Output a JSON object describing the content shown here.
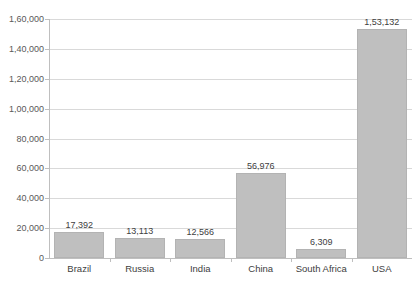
{
  "chart_data": {
    "type": "bar",
    "title": "",
    "subtitle": "",
    "xlabel": "",
    "ylabel": "",
    "categories": [
      "Brazil",
      "Russia",
      "India",
      "China",
      "South Africa",
      "USA"
    ],
    "values": [
      17392,
      13113,
      12566,
      56976,
      6309,
      153132
    ],
    "value_labels": [
      "17,392",
      "13,113",
      "12,566",
      "56,976",
      "6,309",
      "1,53,132"
    ],
    "ylim": [
      0,
      160000
    ],
    "y_tick_values": [
      0,
      20000,
      40000,
      60000,
      80000,
      100000,
      120000,
      140000,
      160000
    ],
    "y_tick_labels": [
      "0",
      "20,000",
      "40,000",
      "60,000",
      "80,000",
      "1,00,000",
      "1,20,000",
      "1,40,000",
      "1,60,000"
    ],
    "number_format": "indian-lakh",
    "grid": "horizontal",
    "legend": "none",
    "series": [
      {
        "name": "",
        "values": [
          17392,
          13113,
          12566,
          56976,
          6309,
          153132
        ]
      }
    ],
    "colors": {
      "bar_fill": "#BFBFBF",
      "bar_border": "#B3B3B3",
      "gridline": "#D9D9D9",
      "axis_line": "#BFBFBF",
      "tick_text": "#595959",
      "label_text": "#404040",
      "background": "#FFFFFF"
    }
  }
}
